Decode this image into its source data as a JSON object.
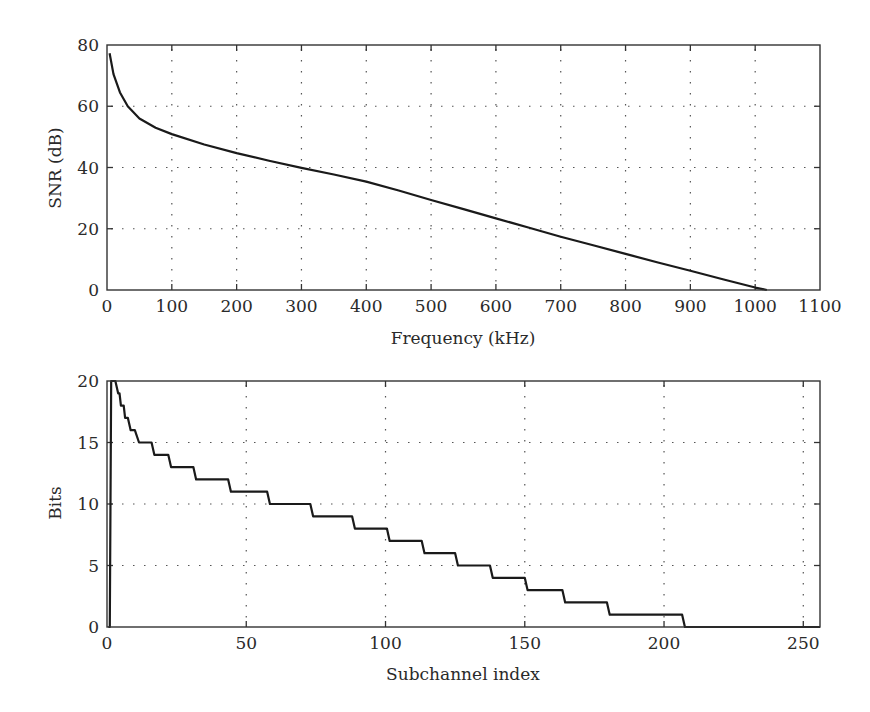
{
  "chart_data": [
    {
      "type": "line",
      "title": "",
      "xlabel": "Frequency (kHz)",
      "ylabel": "SNR (dB)",
      "xlim": [
        0,
        1100
      ],
      "ylim": [
        0,
        80
      ],
      "xticks": [
        0,
        100,
        200,
        300,
        400,
        500,
        600,
        700,
        800,
        900,
        1000,
        1100
      ],
      "yticks": [
        0,
        20,
        40,
        60,
        80
      ],
      "grid": true,
      "legend": null,
      "series": [
        {
          "name": "SNR",
          "x": [
            4,
            10,
            20,
            32,
            50,
            75,
            100,
            150,
            200,
            250,
            300,
            350,
            400,
            450,
            500,
            550,
            600,
            650,
            700,
            750,
            800,
            850,
            900,
            950,
            1000,
            1018
          ],
          "y": [
            77.3,
            70.5,
            64.5,
            60.0,
            56.0,
            53.0,
            50.9,
            47.5,
            44.7,
            42.2,
            39.9,
            37.7,
            35.4,
            32.5,
            29.4,
            26.4,
            23.4,
            20.4,
            17.4,
            14.6,
            11.8,
            9.0,
            6.3,
            3.5,
            0.8,
            0.0
          ]
        }
      ]
    },
    {
      "type": "line",
      "title": "",
      "xlabel": "Subchannel index",
      "ylabel": "Bits",
      "xlim": [
        0,
        256
      ],
      "ylim": [
        0,
        20
      ],
      "xticks": [
        0,
        50,
        100,
        150,
        200,
        250
      ],
      "yticks": [
        0,
        5,
        10,
        15,
        20
      ],
      "grid": true,
      "legend": null,
      "series": [
        {
          "name": "Bit allocation",
          "x": [
            0.5,
            1,
            1.5,
            3,
            4,
            4.5,
            5,
            6,
            6.5,
            7.5,
            8.5,
            10,
            11.5,
            16,
            17,
            22,
            23,
            31,
            32,
            43.5,
            44.5,
            57.5,
            58.5,
            73,
            74,
            88,
            89,
            100.5,
            101.5,
            113,
            114,
            125,
            126,
            137.5,
            138.5,
            150,
            151,
            163.5,
            164.5,
            179.5,
            180.5,
            206.5,
            207.5,
            256
          ],
          "y": [
            0,
            0,
            20,
            20,
            19,
            19,
            18,
            18,
            17,
            17,
            16,
            16,
            15,
            15,
            14,
            14,
            13,
            13,
            12,
            12,
            11,
            11,
            10,
            10,
            9,
            9,
            8,
            8,
            7,
            7,
            6,
            6,
            5,
            5,
            4,
            4,
            3,
            3,
            2,
            2,
            1,
            1,
            0,
            0
          ]
        }
      ]
    }
  ],
  "panels": {
    "top": {
      "ylabel": "SNR (dB)",
      "xlabel": "Frequency (kHz)"
    },
    "bottom": {
      "ylabel": "Bits",
      "xlabel": "Subchannel index"
    }
  }
}
